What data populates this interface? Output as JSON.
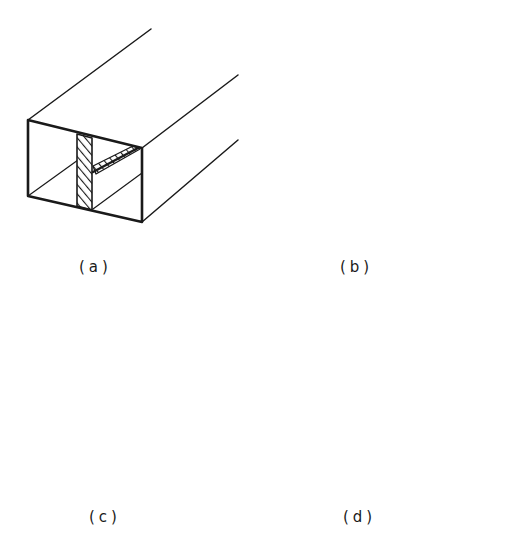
{
  "figure": {
    "stroke_color": "#1a1a1a",
    "background": "#ffffff",
    "panels": [
      {
        "id": "a",
        "label": "(a)",
        "variant": "single vertical weld with inner fillet along top-right corner"
      },
      {
        "id": "b",
        "label": "(b)",
        "variant": "single narrow vertical weld with inner fillet along top-right corner"
      },
      {
        "id": "c",
        "label": "(c)",
        "variant": "wide vertical weld with heavy inner fillet along top-right corner"
      },
      {
        "id": "d",
        "label": "(d)",
        "variant": "double vertical welds, no inner fillet"
      }
    ]
  }
}
